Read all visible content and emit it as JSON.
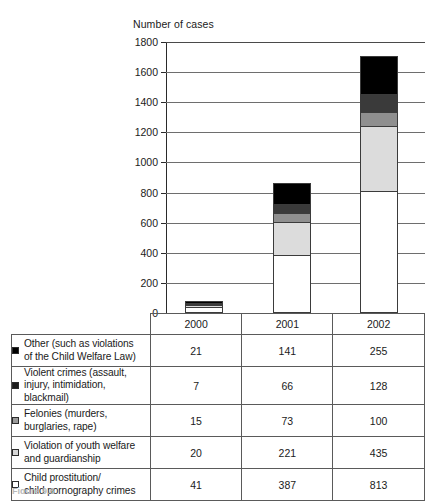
{
  "figure": {
    "caption": "Figure 9.6"
  },
  "chart_data": {
    "type": "bar",
    "subtype": "stacked-bar",
    "title": "",
    "ylabel": "Number of cases",
    "xlabel": "",
    "categories": [
      "2000",
      "2001",
      "2002"
    ],
    "ylim": [
      0,
      1800
    ],
    "ytick_step": 200,
    "yticks": [
      0,
      200,
      400,
      600,
      800,
      1000,
      1200,
      1400,
      1600,
      1800
    ],
    "ytick_labels": [
      "0",
      "200",
      "400",
      "600",
      "800",
      "1000",
      "1200",
      "1400",
      "1600",
      "1800"
    ],
    "grid": true,
    "legend_position": "table-left-column",
    "stack_order_bottom_to_top": [
      "Child prostitution/ child pornography crimes",
      "Violation of youth welfare and guardianship",
      "Felonies (murders, burglaries, rape)",
      "Violent crimes (assault, injury, intimidation, blackmail)",
      "Other (such as violations of the Child Welfare Law)"
    ],
    "series": [
      {
        "name": "Other (such as violations of the Child Welfare Law)",
        "color": "#000000",
        "values": [
          21,
          141,
          255
        ]
      },
      {
        "name": "Violent crimes (assault, injury, intimidation, blackmail)",
        "color": "#3a3a3a",
        "values": [
          7,
          66,
          128
        ]
      },
      {
        "name": "Felonies (murders, burglaries, rape)",
        "color": "#8f8f8f",
        "values": [
          15,
          73,
          100
        ]
      },
      {
        "name": "Violation of youth welfare and guardianship",
        "color": "#dcdcdc",
        "values": [
          20,
          221,
          435
        ]
      },
      {
        "name": "Child prostitution/ child pornography crimes",
        "color": "#ffffff",
        "values": [
          41,
          387,
          813
        ]
      }
    ],
    "totals": [
      104,
      888,
      1731
    ]
  },
  "table": {
    "corner_label": "",
    "columns": [
      "2000",
      "2001",
      "2002"
    ],
    "rows": [
      {
        "swatch": "#000000",
        "label_line1": "Other (such as violations",
        "label_line2": "of the Child Welfare Law)",
        "values": [
          "21",
          "141",
          "255"
        ]
      },
      {
        "swatch": "#1c1c1c",
        "label_line1": "Violent crimes (assault,",
        "label_line2": "injury, intimidation, blackmail)",
        "values": [
          "7",
          "66",
          "128"
        ]
      },
      {
        "swatch": "#9a9a9a",
        "label_line1": "Felonies (murders,",
        "label_line2": "burglaries, rape)",
        "values": [
          "15",
          "73",
          "100"
        ]
      },
      {
        "swatch": "#d8d8d8",
        "label_line1": "Violation of youth welfare",
        "label_line2": "and guardianship",
        "values": [
          "20",
          "221",
          "435"
        ]
      },
      {
        "swatch": "#ffffff",
        "label_line1": "Child prostitution/",
        "label_line2": "child pornography crimes",
        "values": [
          "41",
          "387",
          "813"
        ]
      }
    ]
  }
}
